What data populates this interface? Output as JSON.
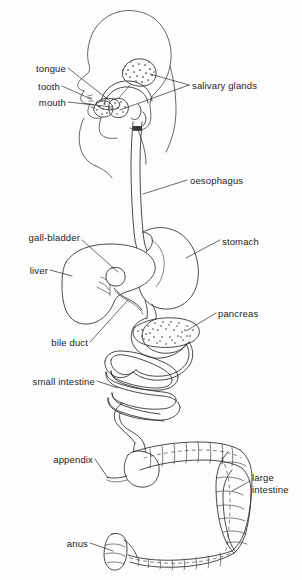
{
  "figure": {
    "background_color": "#fdfdfd",
    "ink_color": "#2b2b2b",
    "style": "line drawing, black ink on white, labelled with leader lines"
  },
  "labels": {
    "tongue": "tongue",
    "tooth": "tooth",
    "mouth": "mouth",
    "salivary_glands": "salivary glands",
    "oesophagus": "oesophagus",
    "gall_bladder": "gall-bladder",
    "liver": "liver",
    "stomach": "stomach",
    "bile_duct": "bile duct",
    "pancreas": "pancreas",
    "small_intestine": "small intestine",
    "appendix": "appendix",
    "large_intestine_line1": "large",
    "large_intestine_line2": "intestine",
    "anus": "anus"
  },
  "structures": [
    {
      "name": "head-profile",
      "label": "head and neck outline"
    },
    {
      "name": "tongue",
      "label": "tongue"
    },
    {
      "name": "tooth",
      "label": "tooth"
    },
    {
      "name": "mouth",
      "label": "mouth"
    },
    {
      "name": "salivary-glands",
      "label": "salivary glands"
    },
    {
      "name": "oesophagus",
      "label": "oesophagus"
    },
    {
      "name": "stomach",
      "label": "stomach"
    },
    {
      "name": "liver",
      "label": "liver"
    },
    {
      "name": "gall-bladder",
      "label": "gall-bladder"
    },
    {
      "name": "bile-duct",
      "label": "bile duct"
    },
    {
      "name": "pancreas",
      "label": "pancreas"
    },
    {
      "name": "small-intestine",
      "label": "small intestine"
    },
    {
      "name": "appendix",
      "label": "appendix"
    },
    {
      "name": "large-intestine",
      "label": "large intestine"
    },
    {
      "name": "anus",
      "label": "anus"
    }
  ]
}
